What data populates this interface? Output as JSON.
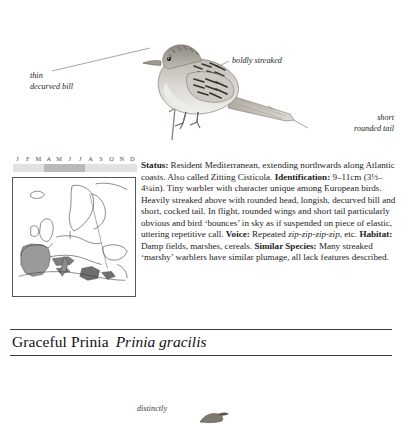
{
  "illustration": {
    "bird_name": "graceful-prinia-perched",
    "callouts": [
      {
        "id": "thin-decurved-bill",
        "line1": "thin",
        "line2": "decurved bill"
      },
      {
        "id": "boldly-streaked",
        "line1": "boldly streaked",
        "line2": ""
      },
      {
        "id": "short-rounded-tail",
        "line1": "short",
        "line2": "rounded tail"
      }
    ]
  },
  "calendar": {
    "months": [
      "J",
      "F",
      "M",
      "A",
      "M",
      "J",
      "J",
      "A",
      "S",
      "O",
      "N",
      "D"
    ],
    "presence": [
      "light",
      "light",
      "light",
      "dark",
      "dark",
      "dark",
      "dark",
      "light",
      "light",
      "light",
      "light",
      "light"
    ],
    "light_color": "#e2e2e2",
    "dark_color": "#b9b9b9"
  },
  "map": {
    "name": "europe-distribution-map",
    "range_fill_color": "#9a9a9a",
    "coastline_color": "#3d3d3d",
    "background_color": "#ffffff"
  },
  "description": {
    "status_label": "Status:",
    "status_text": " Resident Mediterranean, extending northwards along Atlantic coasts. Also called Zitting Cisticola.",
    "identification_label": "Identification:",
    "identification_text": " 9–11cm (3½–4¼in). Tiny warbler with character unique among European birds. Heavily streaked above with rounded head, longish, decurved bill and short, cocked tail. In flight, rounded wings and short tail particularly obvious and bird ‘bounces’ in sky as if suspended on piece of elastic, uttering repetitive call.",
    "voice_label": "Voice:",
    "voice_text_before": " Repeated ",
    "voice_call": "zip-zip-zip-zip",
    "voice_text_after": ", etc.",
    "habitat_label": "Habitat:",
    "habitat_text": " Damp fields, marshes, cereals.",
    "similar_species_label": "Similar Species:",
    "similar_species_text": " Many streaked ‘marshy’ warblers have similar plumage, all lack features described."
  },
  "species_heading": {
    "common_name": "Graceful Prinia",
    "scientific_name": "Prinia gracilis"
  },
  "next_entry": {
    "callout": "distinctly"
  }
}
